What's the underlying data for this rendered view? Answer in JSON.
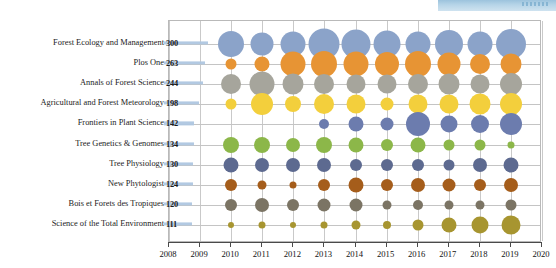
{
  "chart_data": {
    "type": "scatter",
    "title": "",
    "xlabel": "",
    "ylabel": "",
    "xlim": [
      2008,
      2020
    ],
    "grid": true,
    "legend": "none",
    "x_ticks": [
      2008,
      2009,
      2010,
      2011,
      2012,
      2013,
      2014,
      2015,
      2016,
      2017,
      2018,
      2019,
      2020
    ],
    "categories": [
      "Forest Ecology and Management",
      "Plos One",
      "Annals of Forest Science",
      "Agricultural and Forest Meteorology",
      "Frontiers in Plant Science",
      "Tree Genetics & Genomes",
      "Tree Physiology",
      "New Phytologist",
      "Bois et Forets des Tropiques",
      "Science of the Total Environment"
    ],
    "category_totals": [
      300,
      263,
      244,
      198,
      142,
      134,
      130,
      124,
      120,
      111
    ],
    "series": [
      {
        "name": "Forest Ecology and Management",
        "color": "#8ba3c9",
        "points": [
          {
            "x": 2010,
            "size": 26
          },
          {
            "x": 2011,
            "size": 23
          },
          {
            "x": 2012,
            "size": 25
          },
          {
            "x": 2013,
            "size": 31
          },
          {
            "x": 2014,
            "size": 29
          },
          {
            "x": 2015,
            "size": 27
          },
          {
            "x": 2016,
            "size": 25
          },
          {
            "x": 2017,
            "size": 28
          },
          {
            "x": 2018,
            "size": 25
          },
          {
            "x": 2019,
            "size": 30
          }
        ]
      },
      {
        "name": "Plos One",
        "color": "#e79434",
        "points": [
          {
            "x": 2010,
            "size": 11
          },
          {
            "x": 2011,
            "size": 15
          },
          {
            "x": 2012,
            "size": 25
          },
          {
            "x": 2013,
            "size": 26
          },
          {
            "x": 2014,
            "size": 25
          },
          {
            "x": 2015,
            "size": 24
          },
          {
            "x": 2016,
            "size": 26
          },
          {
            "x": 2017,
            "size": 23
          },
          {
            "x": 2018,
            "size": 20
          },
          {
            "x": 2019,
            "size": 21
          }
        ]
      },
      {
        "name": "Annals of Forest Science",
        "color": "#a6a59c",
        "points": [
          {
            "x": 2010,
            "size": 20
          },
          {
            "x": 2011,
            "size": 25
          },
          {
            "x": 2012,
            "size": 21
          },
          {
            "x": 2013,
            "size": 20
          },
          {
            "x": 2014,
            "size": 19
          },
          {
            "x": 2015,
            "size": 19
          },
          {
            "x": 2016,
            "size": 20
          },
          {
            "x": 2017,
            "size": 21
          },
          {
            "x": 2018,
            "size": 19
          },
          {
            "x": 2019,
            "size": 22
          }
        ]
      },
      {
        "name": "Agricultural and Forest Meteorology",
        "color": "#f3cf3c",
        "points": [
          {
            "x": 2010,
            "size": 11
          },
          {
            "x": 2011,
            "size": 22
          },
          {
            "x": 2012,
            "size": 16
          },
          {
            "x": 2013,
            "size": 20
          },
          {
            "x": 2014,
            "size": 19
          },
          {
            "x": 2015,
            "size": 13
          },
          {
            "x": 2016,
            "size": 19
          },
          {
            "x": 2017,
            "size": 19
          },
          {
            "x": 2018,
            "size": 21
          },
          {
            "x": 2019,
            "size": 22
          }
        ]
      },
      {
        "name": "Frontiers in Plant Science",
        "color": "#6c7cae",
        "points": [
          {
            "x": 2013,
            "size": 10
          },
          {
            "x": 2014,
            "size": 15
          },
          {
            "x": 2015,
            "size": 13
          },
          {
            "x": 2016,
            "size": 24
          },
          {
            "x": 2017,
            "size": 17
          },
          {
            "x": 2018,
            "size": 18
          },
          {
            "x": 2019,
            "size": 22
          }
        ]
      },
      {
        "name": "Tree Genetics & Genomes",
        "color": "#8cb749",
        "points": [
          {
            "x": 2010,
            "size": 16
          },
          {
            "x": 2011,
            "size": 16
          },
          {
            "x": 2012,
            "size": 14
          },
          {
            "x": 2013,
            "size": 16
          },
          {
            "x": 2014,
            "size": 15
          },
          {
            "x": 2015,
            "size": 12
          },
          {
            "x": 2016,
            "size": 15
          },
          {
            "x": 2017,
            "size": 11
          },
          {
            "x": 2018,
            "size": 11
          },
          {
            "x": 2019,
            "size": 7
          }
        ]
      },
      {
        "name": "Tree Physiology",
        "color": "#5d6a90",
        "points": [
          {
            "x": 2010,
            "size": 15
          },
          {
            "x": 2011,
            "size": 14
          },
          {
            "x": 2012,
            "size": 14
          },
          {
            "x": 2013,
            "size": 14
          },
          {
            "x": 2014,
            "size": 12
          },
          {
            "x": 2015,
            "size": 12
          },
          {
            "x": 2016,
            "size": 12
          },
          {
            "x": 2017,
            "size": 11
          },
          {
            "x": 2018,
            "size": 14
          },
          {
            "x": 2019,
            "size": 15
          }
        ]
      },
      {
        "name": "New Phytologist",
        "color": "#a55d1b",
        "points": [
          {
            "x": 2010,
            "size": 12
          },
          {
            "x": 2011,
            "size": 9
          },
          {
            "x": 2012,
            "size": 7
          },
          {
            "x": 2013,
            "size": 12
          },
          {
            "x": 2014,
            "size": 15
          },
          {
            "x": 2015,
            "size": 12
          },
          {
            "x": 2016,
            "size": 14
          },
          {
            "x": 2017,
            "size": 13
          },
          {
            "x": 2018,
            "size": 12
          },
          {
            "x": 2019,
            "size": 14
          }
        ]
      },
      {
        "name": "Bois et Forets des Tropiques",
        "color": "#7b7464",
        "points": [
          {
            "x": 2010,
            "size": 12
          },
          {
            "x": 2011,
            "size": 14
          },
          {
            "x": 2012,
            "size": 12
          },
          {
            "x": 2013,
            "size": 13
          },
          {
            "x": 2014,
            "size": 13
          },
          {
            "x": 2015,
            "size": 9
          },
          {
            "x": 2016,
            "size": 10
          },
          {
            "x": 2017,
            "size": 9
          },
          {
            "x": 2018,
            "size": 9
          },
          {
            "x": 2019,
            "size": 11
          }
        ]
      },
      {
        "name": "Science of the Total Environment",
        "color": "#a79530",
        "points": [
          {
            "x": 2010,
            "size": 6
          },
          {
            "x": 2011,
            "size": 7
          },
          {
            "x": 2012,
            "size": 6
          },
          {
            "x": 2013,
            "size": 7
          },
          {
            "x": 2014,
            "size": 9
          },
          {
            "x": 2015,
            "size": 8
          },
          {
            "x": 2016,
            "size": 11
          },
          {
            "x": 2017,
            "size": 15
          },
          {
            "x": 2018,
            "size": 17
          },
          {
            "x": 2019,
            "size": 19
          }
        ]
      }
    ]
  },
  "colors": {
    "value_bar": "#aec6e0",
    "grid": "#c4c4c4",
    "frame": "#b9b9b9",
    "axis": "#4a4a4a",
    "topbar": "#9cc3dd"
  }
}
